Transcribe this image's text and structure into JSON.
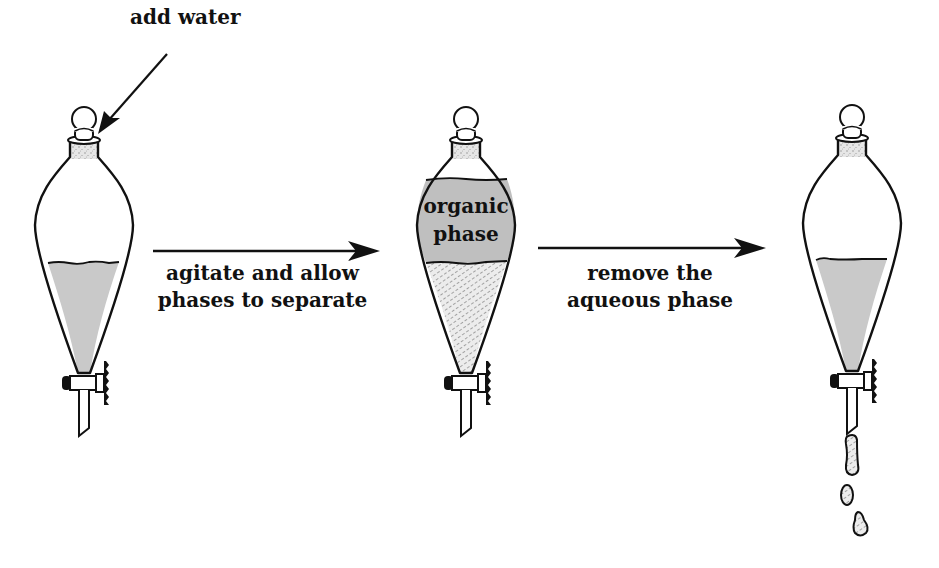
{
  "diagram": {
    "colors": {
      "outline": "#111111",
      "liquid_fill": "#c8c8c8",
      "aqueous_stipple": "#dedede",
      "organic_fill": "#bdbdbd",
      "background": "#ffffff"
    },
    "steps": [
      {
        "id": "funnel-1",
        "description": "Separatory funnel with single liquid layer",
        "annotation": "add water"
      },
      {
        "id": "funnel-2",
        "description": "Separatory funnel with two layers",
        "layer_label": "organic phase",
        "layer_label_lines": [
          "organic",
          "phase"
        ],
        "lower_layer": "aqueous (stippled)"
      },
      {
        "id": "funnel-3",
        "description": "Separatory funnel draining lower layer, droplets falling",
        "droplets": 3
      }
    ],
    "arrows": [
      {
        "from": "funnel-1",
        "to": "funnel-2",
        "label_lines": [
          "agitate and allow",
          "phases to separate"
        ]
      },
      {
        "from": "funnel-2",
        "to": "funnel-3",
        "label_lines": [
          "remove the",
          "aqueous phase"
        ]
      }
    ]
  }
}
